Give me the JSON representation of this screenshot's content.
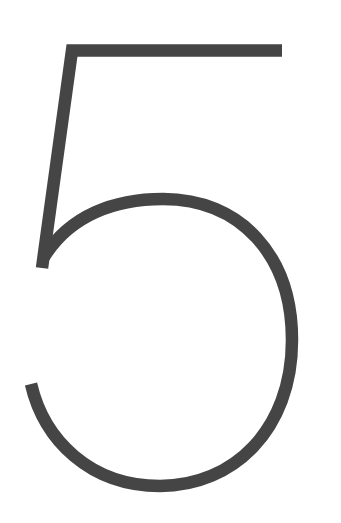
{
  "glyph": {
    "character": "5",
    "stroke_color": "#454545",
    "background": "#ffffff"
  }
}
